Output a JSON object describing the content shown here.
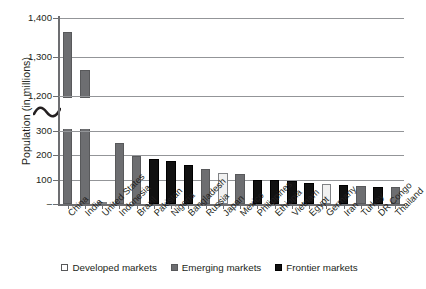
{
  "chart_data": {
    "type": "bar",
    "title": "",
    "subtitle": "",
    "xlabel": "",
    "ylabel": "Population (in millions)",
    "grid": true,
    "legend_position": "bottom",
    "axis_break": {
      "present": true,
      "between": [
        300,
        1200
      ],
      "note": "y-axis broken between 300 and 1,200"
    },
    "ylim": [
      0,
      1400
    ],
    "ytick_labels": [
      "–",
      "100",
      "200",
      "300",
      "1,200",
      "1,300",
      "1,400"
    ],
    "ytick_values": [
      0,
      100,
      200,
      300,
      1200,
      1300,
      1400
    ],
    "categories": [
      "China",
      "India",
      "United States",
      "Indonesia",
      "Brazil",
      "Pakistan",
      "Nigeria",
      "Bangladesh",
      "Russia",
      "Japan",
      "Mexico",
      "Philippines",
      "Ethiopia",
      "Vietnam",
      "Egypt",
      "Germany",
      "Iran",
      "Turkey",
      "DR Congo",
      "Thailand"
    ],
    "values": [
      1364,
      1267,
      319,
      252,
      199,
      185,
      177,
      159,
      144,
      127,
      125,
      100,
      97,
      93,
      88,
      81,
      78,
      76,
      71,
      68
    ],
    "groups": [
      "emerging",
      "emerging",
      "developed",
      "emerging",
      "emerging",
      "frontier",
      "frontier",
      "frontier",
      "emerging",
      "developed",
      "emerging",
      "frontier",
      "frontier",
      "frontier",
      "frontier",
      "developed",
      "frontier",
      "emerging",
      "frontier",
      "emerging"
    ],
    "series": [
      {
        "name": "Developed markets",
        "color": "#ffffff"
      },
      {
        "name": "Emerging markets",
        "color": "#6d6e71"
      },
      {
        "name": "Frontier markets",
        "color": "#111111"
      }
    ]
  },
  "axis": {
    "y_title": "Population (in millions)",
    "ticks": [
      {
        "label": "1,400",
        "value": 1400
      },
      {
        "label": "1,300",
        "value": 1300
      },
      {
        "label": "1,200",
        "value": 1200
      },
      {
        "label": "300",
        "value": 300
      },
      {
        "label": "200",
        "value": 200
      },
      {
        "label": "100",
        "value": 100
      },
      {
        "label": "–",
        "value": 0
      }
    ]
  },
  "legend": {
    "items": [
      {
        "label": "Developed markets",
        "swatch": "developed"
      },
      {
        "label": "Emerging markets",
        "swatch": "emerging"
      },
      {
        "label": "Frontier markets",
        "swatch": "frontier"
      }
    ]
  },
  "colors": {
    "developed": "#ffffff",
    "emerging": "#6d6e71",
    "frontier": "#111111",
    "grid": "#939598",
    "axis": "#6d6e71",
    "text": "#231f20"
  }
}
